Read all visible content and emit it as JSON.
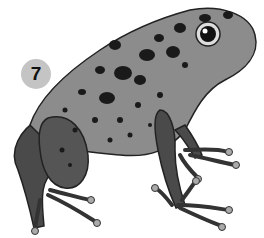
{
  "badge": {
    "number": "7"
  },
  "illustration": {
    "subject": "spotted poison dart frog",
    "style": "grayscale illustration",
    "colors": {
      "body": "#8c8c8c",
      "legs": "#4a4a4a",
      "spots": "#1a1a1a",
      "outline": "#222222",
      "badge": "#c4c4c4"
    }
  }
}
